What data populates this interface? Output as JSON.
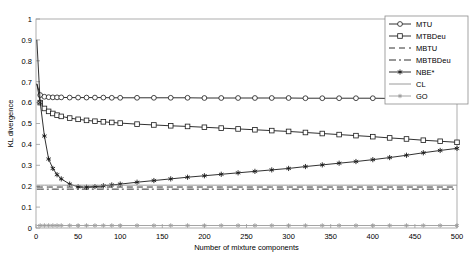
{
  "chart_data": {
    "type": "line",
    "title": "",
    "xlabel": "Number of mixture components",
    "ylabel": "KL divergence",
    "xlim": [
      0,
      500
    ],
    "ylim": [
      0,
      1
    ],
    "xticks": [
      0,
      50,
      100,
      150,
      200,
      250,
      300,
      350,
      400,
      450,
      500
    ],
    "yticks": [
      0,
      0.1,
      0.2,
      0.3,
      0.4,
      0.5,
      0.6,
      0.7,
      0.8,
      0.9,
      1
    ],
    "ytick_labels": [
      "0",
      "0.1",
      "0.2",
      "0.3",
      "0.4",
      "0.5",
      "0.6",
      "0.7",
      "0.8",
      "0.9",
      "1"
    ],
    "xtick_labels": [
      "0",
      "50",
      "100",
      "150",
      "200",
      "250",
      "300",
      "350",
      "400",
      "450",
      "500"
    ],
    "grid": false,
    "legend_position": "top-right",
    "x": [
      1,
      5,
      10,
      15,
      20,
      25,
      30,
      40,
      50,
      60,
      70,
      80,
      90,
      100,
      120,
      140,
      160,
      180,
      200,
      220,
      240,
      260,
      280,
      300,
      320,
      340,
      360,
      380,
      400,
      420,
      440,
      460,
      480,
      500
    ],
    "series": [
      {
        "name": "MTU",
        "style": "solid",
        "marker": "circle",
        "values": [
          0.69,
          0.636,
          0.628,
          0.626,
          0.625,
          0.625,
          0.625,
          0.624,
          0.624,
          0.624,
          0.624,
          0.624,
          0.623,
          0.623,
          0.623,
          0.623,
          0.623,
          0.623,
          0.622,
          0.622,
          0.622,
          0.622,
          0.622,
          0.622,
          0.621,
          0.621,
          0.621,
          0.621,
          0.621,
          0.62,
          0.62,
          0.62,
          0.62,
          0.62
        ]
      },
      {
        "name": "MTBDeu",
        "style": "solid",
        "marker": "square",
        "values": [
          0.69,
          0.6,
          0.572,
          0.558,
          0.548,
          0.54,
          0.534,
          0.526,
          0.52,
          0.515,
          0.511,
          0.508,
          0.505,
          0.502,
          0.497,
          0.493,
          0.489,
          0.486,
          0.482,
          0.478,
          0.474,
          0.47,
          0.466,
          0.462,
          0.457,
          0.452,
          0.447,
          0.442,
          0.437,
          0.431,
          0.426,
          0.42,
          0.415,
          0.41
        ]
      },
      {
        "name": "MBTU",
        "style": "dashed",
        "marker": "none",
        "values": [
          0.196,
          0.196,
          0.196,
          0.196,
          0.196,
          0.196,
          0.196,
          0.196,
          0.196,
          0.196,
          0.196,
          0.196,
          0.196,
          0.196,
          0.196,
          0.196,
          0.196,
          0.196,
          0.196,
          0.196,
          0.196,
          0.196,
          0.196,
          0.196,
          0.196,
          0.196,
          0.196,
          0.196,
          0.196,
          0.196,
          0.196,
          0.196,
          0.196,
          0.196
        ]
      },
      {
        "name": "MBTBDeu",
        "style": "dashdot",
        "marker": "none",
        "values": [
          0.186,
          0.186,
          0.186,
          0.186,
          0.186,
          0.186,
          0.186,
          0.186,
          0.186,
          0.186,
          0.186,
          0.186,
          0.186,
          0.186,
          0.186,
          0.186,
          0.186,
          0.186,
          0.186,
          0.186,
          0.186,
          0.186,
          0.186,
          0.186,
          0.186,
          0.186,
          0.186,
          0.186,
          0.186,
          0.186,
          0.186,
          0.186,
          0.186,
          0.186
        ]
      },
      {
        "name": "NBE*",
        "style": "solid",
        "marker": "asterisk",
        "values": [
          0.9,
          0.6,
          0.44,
          0.33,
          0.285,
          0.255,
          0.235,
          0.21,
          0.197,
          0.195,
          0.198,
          0.202,
          0.206,
          0.21,
          0.219,
          0.227,
          0.235,
          0.243,
          0.25,
          0.257,
          0.264,
          0.271,
          0.278,
          0.285,
          0.294,
          0.302,
          0.31,
          0.318,
          0.327,
          0.337,
          0.348,
          0.36,
          0.371,
          0.381
        ]
      },
      {
        "name": "CL",
        "style": "solid",
        "marker": "none",
        "values": [
          0.205,
          0.205,
          0.205,
          0.205,
          0.205,
          0.205,
          0.205,
          0.205,
          0.205,
          0.205,
          0.205,
          0.205,
          0.205,
          0.205,
          0.205,
          0.205,
          0.205,
          0.205,
          0.205,
          0.205,
          0.205,
          0.205,
          0.205,
          0.205,
          0.205,
          0.205,
          0.205,
          0.205,
          0.205,
          0.205,
          0.205,
          0.205,
          0.205,
          0.205
        ]
      },
      {
        "name": "GO",
        "style": "solid",
        "marker": "star",
        "values": [
          0.012,
          0.012,
          0.012,
          0.012,
          0.012,
          0.012,
          0.012,
          0.012,
          0.012,
          0.012,
          0.012,
          0.012,
          0.012,
          0.012,
          0.012,
          0.012,
          0.012,
          0.012,
          0.012,
          0.012,
          0.012,
          0.012,
          0.012,
          0.012,
          0.012,
          0.012,
          0.012,
          0.012,
          0.012,
          0.012,
          0.012,
          0.012,
          0.012,
          0.012
        ]
      }
    ],
    "colors": {
      "line": "#1a1a1a",
      "axis": "#9a9a9a",
      "cl_line": "#8f8f8f",
      "go_line": "#9a9a9a",
      "background": "#ffffff"
    }
  }
}
